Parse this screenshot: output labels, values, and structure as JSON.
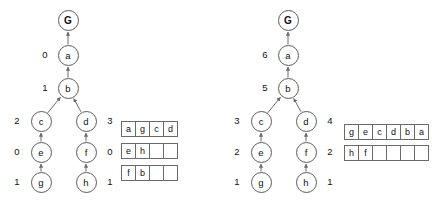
{
  "figure": {
    "caption": "",
    "panels": [
      {
        "id": "left",
        "name": "search-tree-left",
        "nodes": [
          {
            "id": "G",
            "label": "G",
            "x": 68,
            "y": 20,
            "goal": true
          },
          {
            "id": "a",
            "label": "a",
            "x": 68,
            "y": 55,
            "goal": false
          },
          {
            "id": "b",
            "label": "b",
            "x": 68,
            "y": 88,
            "goal": false
          },
          {
            "id": "c",
            "label": "c",
            "x": 41,
            "y": 121,
            "goal": false
          },
          {
            "id": "d",
            "label": "d",
            "x": 86,
            "y": 121,
            "goal": false
          },
          {
            "id": "e",
            "label": "e",
            "x": 41,
            "y": 152,
            "goal": false
          },
          {
            "id": "f",
            "label": "f",
            "x": 86,
            "y": 152,
            "goal": false
          },
          {
            "id": "g",
            "label": "g",
            "x": 41,
            "y": 182,
            "goal": false
          },
          {
            "id": "h",
            "label": "h",
            "x": 86,
            "y": 182,
            "goal": false
          }
        ],
        "edges": [
          {
            "from": "a",
            "to": "G"
          },
          {
            "from": "b",
            "to": "a"
          },
          {
            "from": "c",
            "to": "b"
          },
          {
            "from": "d",
            "to": "b"
          },
          {
            "from": "e",
            "to": "c"
          },
          {
            "from": "f",
            "to": "d"
          },
          {
            "from": "g",
            "to": "e"
          },
          {
            "from": "h",
            "to": "f"
          }
        ],
        "node_values": [
          {
            "node": "a",
            "value": "0",
            "x": 45,
            "y": 55
          },
          {
            "node": "b",
            "value": "1",
            "x": 45,
            "y": 88
          },
          {
            "node": "c",
            "value": "2",
            "x": 17,
            "y": 121
          },
          {
            "node": "d",
            "value": "3",
            "x": 110,
            "y": 121
          },
          {
            "node": "e",
            "value": "0",
            "x": 17,
            "y": 152
          },
          {
            "node": "f",
            "value": "0",
            "x": 110,
            "y": 152
          },
          {
            "node": "g",
            "value": "1",
            "x": 17,
            "y": 182
          },
          {
            "node": "h",
            "value": "1",
            "x": 110,
            "y": 182
          }
        ],
        "table": {
          "x": 121,
          "y": 121,
          "columns": 4,
          "row_gap": 6,
          "rows": [
            [
              "a",
              "g",
              "c",
              "d"
            ],
            [
              "e",
              "h",
              "",
              ""
            ],
            [
              "f",
              "b",
              "",
              ""
            ]
          ]
        }
      },
      {
        "id": "right",
        "name": "search-tree-right",
        "nodes": [
          {
            "id": "G",
            "label": "G",
            "x": 72,
            "y": 20,
            "goal": true
          },
          {
            "id": "a",
            "label": "a",
            "x": 72,
            "y": 55,
            "goal": false
          },
          {
            "id": "b",
            "label": "b",
            "x": 72,
            "y": 88,
            "goal": false
          },
          {
            "id": "c",
            "label": "c",
            "x": 45,
            "y": 121,
            "goal": false
          },
          {
            "id": "d",
            "label": "d",
            "x": 90,
            "y": 121,
            "goal": false
          },
          {
            "id": "e",
            "label": "e",
            "x": 45,
            "y": 152,
            "goal": false
          },
          {
            "id": "f",
            "label": "f",
            "x": 90,
            "y": 152,
            "goal": false
          },
          {
            "id": "g",
            "label": "g",
            "x": 45,
            "y": 182,
            "goal": false
          },
          {
            "id": "h",
            "label": "h",
            "x": 90,
            "y": 182,
            "goal": false
          }
        ],
        "edges": [
          {
            "from": "a",
            "to": "G"
          },
          {
            "from": "b",
            "to": "a"
          },
          {
            "from": "c",
            "to": "b"
          },
          {
            "from": "d",
            "to": "b"
          },
          {
            "from": "e",
            "to": "c"
          },
          {
            "from": "f",
            "to": "d"
          },
          {
            "from": "g",
            "to": "e"
          },
          {
            "from": "h",
            "to": "f"
          }
        ],
        "node_values": [
          {
            "node": "a",
            "value": "6",
            "x": 49,
            "y": 55
          },
          {
            "node": "b",
            "value": "5",
            "x": 49,
            "y": 88
          },
          {
            "node": "c",
            "value": "3",
            "x": 21,
            "y": 121
          },
          {
            "node": "d",
            "value": "4",
            "x": 114,
            "y": 121
          },
          {
            "node": "e",
            "value": "2",
            "x": 21,
            "y": 152
          },
          {
            "node": "f",
            "value": "2",
            "x": 114,
            "y": 152
          },
          {
            "node": "g",
            "value": "1",
            "x": 21,
            "y": 182
          },
          {
            "node": "h",
            "value": "1",
            "x": 114,
            "y": 182
          }
        ],
        "table": {
          "x": 128,
          "y": 124,
          "columns": 6,
          "row_gap": 5,
          "rows": [
            [
              "g",
              "e",
              "c",
              "d",
              "b",
              "a"
            ],
            [
              "h",
              "f",
              "",
              "",
              "",
              ""
            ]
          ]
        }
      }
    ],
    "colors": {
      "background": "#ffffff",
      "node_stroke": "#5b5b5b",
      "edge_stroke": "#6a6a6a",
      "table_stroke": "#6a6a6a",
      "text": "#111111"
    }
  }
}
